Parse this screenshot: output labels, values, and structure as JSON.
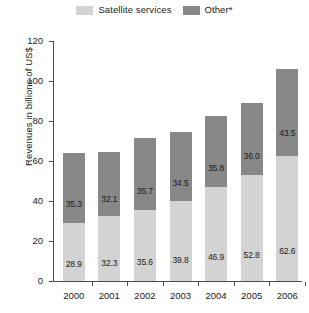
{
  "chart_data": {
    "type": "bar",
    "subtype": "stacked-vertical-bar",
    "title": "",
    "xlabel": "",
    "ylabel": "Revenues in billions of US$",
    "categories": [
      "2000",
      "2001",
      "2002",
      "2003",
      "2004",
      "2005",
      "2006"
    ],
    "series": [
      {
        "name": "Satellite services",
        "color": "#d3d3d3",
        "values": [
          28.9,
          32.3,
          35.6,
          39.8,
          46.9,
          52.8,
          62.6
        ]
      },
      {
        "name": "Other*",
        "color": "#888888",
        "values": [
          35.3,
          32.1,
          35.7,
          34.5,
          35.8,
          36.0,
          43.5
        ]
      }
    ],
    "totals": [
      64.2,
      64.4,
      71.3,
      74.3,
      82.7,
      88.8,
      106.1
    ],
    "ylim": [
      0,
      120
    ],
    "yticks": [
      0,
      20,
      40,
      60,
      80,
      100,
      120
    ],
    "ytick_labels": [
      "0",
      "20",
      "40",
      "60",
      "80",
      "100",
      "120"
    ],
    "grid": false,
    "legend_position": "top-center",
    "stacked": true,
    "data_labels": true
  },
  "legend": {
    "entries": [
      {
        "label": "Satellite services",
        "swatch_name": "legend-swatch-satellite-services"
      },
      {
        "label": "Other*",
        "swatch_name": "legend-swatch-other"
      }
    ]
  },
  "colors": {
    "satellite_services": "#d3d3d3",
    "other": "#888888",
    "axis": "#4d4d4d",
    "text": "#1a1a1a",
    "background": "#ffffff"
  }
}
